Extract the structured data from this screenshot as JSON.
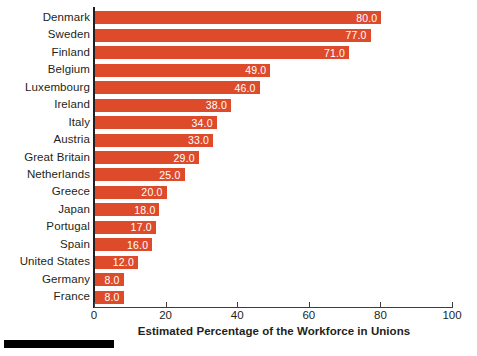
{
  "chart_data": {
    "type": "bar",
    "orientation": "horizontal",
    "title": "",
    "xlabel": "Estimated Percentage of the Workforce in Unions",
    "ylabel": "",
    "xlim": [
      0,
      100
    ],
    "xticks": [
      0,
      20,
      40,
      60,
      80,
      100
    ],
    "grid": false,
    "legend": null,
    "bar_color": "#dd4b2b",
    "value_label_color": "#ffffff",
    "value_label_format": "0.0",
    "categories": [
      "Denmark",
      "Sweden",
      "Finland",
      "Belgium",
      "Luxembourg",
      "Ireland",
      "Italy",
      "Austria",
      "Great Britain",
      "Netherlands",
      "Greece",
      "Japan",
      "Portugal",
      "Spain",
      "United States",
      "Germany",
      "France"
    ],
    "values": [
      80.0,
      77.0,
      71.0,
      49.0,
      46.0,
      38.0,
      34.0,
      33.0,
      29.0,
      25.0,
      20.0,
      18.0,
      17.0,
      16.0,
      12.0,
      8.0,
      8.0
    ],
    "value_labels": [
      "80.0",
      "77.0",
      "71.0",
      "49.0",
      "46.0",
      "38.0",
      "34.0",
      "33.0",
      "29.0",
      "25.0",
      "20.0",
      "18.0",
      "17.0",
      "16.0",
      "12.0",
      "8.0",
      "8.0"
    ],
    "tick_labels": [
      "0",
      "20",
      "40",
      "60",
      "80",
      "100"
    ]
  }
}
